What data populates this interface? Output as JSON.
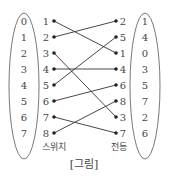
{
  "figure": {
    "caption": "[그림]",
    "left_oval_values": [
      "0",
      "1",
      "2",
      "3",
      "4",
      "5",
      "6",
      "7"
    ],
    "right_oval_values": [
      "1",
      "4",
      "0",
      "3",
      "5",
      "7",
      "2",
      "6"
    ],
    "switch_label": "스위치",
    "bulb_label": "전등",
    "switch_numbers": [
      "1",
      "2",
      "3",
      "4",
      "5",
      "6",
      "7",
      "8"
    ],
    "bulb_numbers": [
      "2",
      "5",
      "1",
      "4",
      "6",
      "8",
      "3",
      "7"
    ],
    "connections": [
      {
        "switch": "1",
        "bulb": "1"
      },
      {
        "switch": "2",
        "bulb": "2"
      },
      {
        "switch": "3",
        "bulb": "3"
      },
      {
        "switch": "4",
        "bulb": "4"
      },
      {
        "switch": "5",
        "bulb": "5"
      },
      {
        "switch": "6",
        "bulb": "6"
      },
      {
        "switch": "7",
        "bulb": "7"
      },
      {
        "switch": "8",
        "bulb": "8"
      }
    ]
  }
}
